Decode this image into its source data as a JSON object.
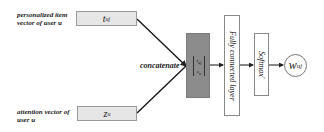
{
  "inputs": {
    "top": {
      "label_line1": "personalized item",
      "label_line2": "vector of user u",
      "symbol": "t",
      "subscript": "uj"
    },
    "bottom": {
      "label_line1": "attention vector of",
      "label_line2": "user u",
      "symbol": "z",
      "subscript": "u"
    }
  },
  "concat": {
    "label": "concatenate",
    "inner_top": "t",
    "inner_top_sub": "uj",
    "inner_bottom": "z",
    "inner_bottom_sub": "u",
    "color": "#8c8c8c"
  },
  "layers": {
    "fc": "Fully connected layer",
    "softmax": "Softmax'"
  },
  "output": {
    "symbol": "w",
    "subscript": "uj"
  }
}
